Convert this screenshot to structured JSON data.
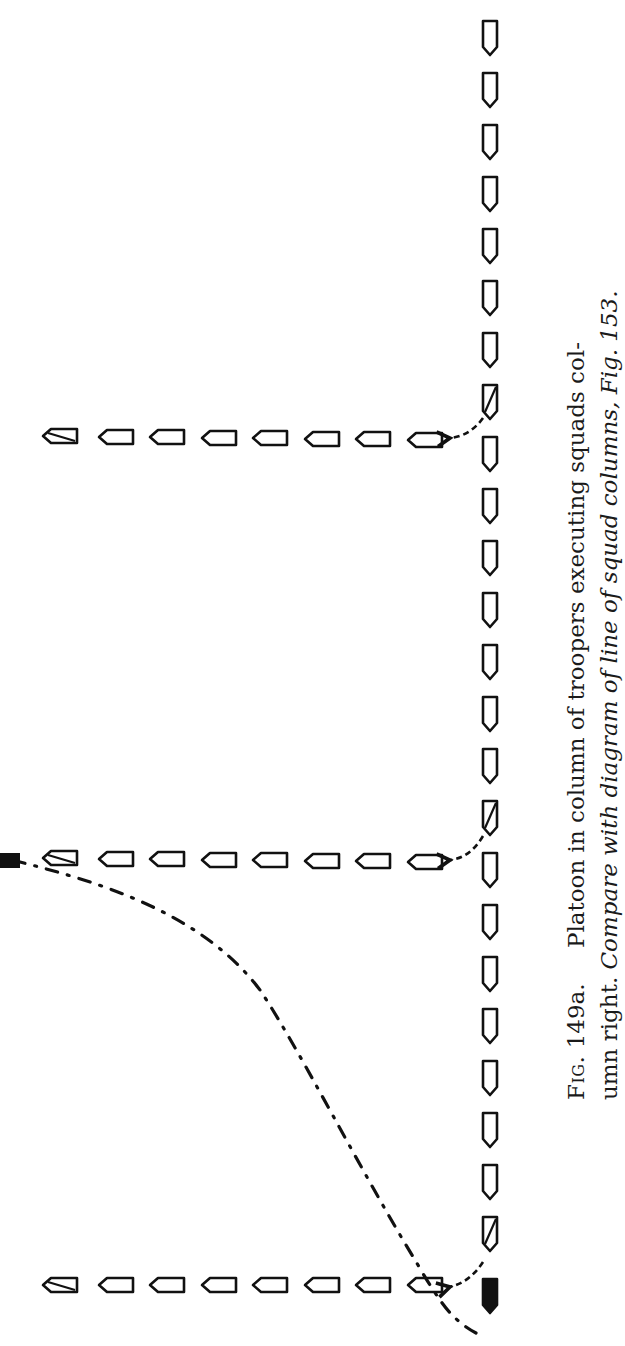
{
  "figure": {
    "label": "Fig.",
    "number": "149a.",
    "caption_line1": "Platoon in column of troopers executing squads col-",
    "caption_line2_plain": "umn right.",
    "caption_line2_italic": "Compare with diagram of line of squad columns, Fig. 153."
  },
  "diagram": {
    "ink_color": "#111111",
    "paper_color": "#ffffff",
    "original_column": {
      "orientation": "vertical",
      "x": 490,
      "direction": "down",
      "trooper_count": 25,
      "y_start": 30,
      "y_step": 52,
      "shaded_positions": [
        8,
        16,
        24
      ],
      "leader_filled_position": 25
    },
    "squad_columns": [
      {
        "name": "squad-1",
        "y": 440,
        "x_start": 425,
        "x_step": -51.5,
        "count": 8,
        "arrow_from": "trooper-8"
      },
      {
        "name": "squad-2",
        "y": 862,
        "x_start": 425,
        "x_step": -51.5,
        "count": 8,
        "arrow_from": "trooper-16"
      },
      {
        "name": "squad-3",
        "y": 1285,
        "x_start": 425,
        "x_step": -51.5,
        "count": 8,
        "arrow_from": "trooper-24"
      }
    ],
    "leader": {
      "final_x": 8,
      "final_y": 862,
      "path": "dash-dot curve from foot of column to head of squad 2"
    }
  }
}
